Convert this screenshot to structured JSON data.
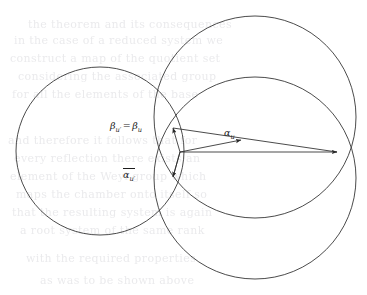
{
  "figure": {
    "background_color": "#ffffff",
    "stroke_color": "#2a2a2a",
    "width": 367,
    "height": 295
  },
  "labels": {
    "beta_equality": {
      "text": "βu′ = βu",
      "beta_left_symbol": "β",
      "beta_left_sub": "u′",
      "relation": "=",
      "beta_right_symbol": "β",
      "beta_right_sub": "u",
      "x": 110,
      "y": 121
    },
    "alpha_u": {
      "text": "αu",
      "symbol": "α",
      "sub": "u",
      "x": 224,
      "y": 128
    },
    "alpha_u_prime_bar": {
      "text": "αu′",
      "symbol": "α",
      "sub": "u′",
      "overlined": true,
      "x": 123,
      "y": 168
    }
  },
  "circles": [
    {
      "name": "left-circle",
      "cx": 100,
      "cy": 151,
      "r": 84
    },
    {
      "name": "upper-right-circle",
      "cx": 255,
      "cy": 117,
      "r": 101
    },
    {
      "name": "lower-right-circle",
      "cx": 255,
      "cy": 178,
      "r": 101
    }
  ],
  "vertex": {
    "x": 180,
    "y": 152
  },
  "arrows": [
    {
      "name": "horizontal-alpha-arrow",
      "x1": 180,
      "y1": 152,
      "x2": 337,
      "y2": 152
    },
    {
      "name": "alpha-u-arrow",
      "x1": 180,
      "y1": 152,
      "x2": 241,
      "y2": 140
    },
    {
      "name": "beta-up-arrow",
      "x1": 180,
      "y1": 152,
      "x2": 173,
      "y2": 128
    },
    {
      "name": "beta-down-arrow",
      "x1": 180,
      "y1": 152,
      "x2": 173,
      "y2": 177
    }
  ],
  "connector_lines": [
    {
      "name": "upper-chord-line",
      "x1": 173,
      "y1": 128,
      "x2": 337,
      "y2": 152
    },
    {
      "name": "lower-chord-line",
      "x1": 173,
      "y1": 177,
      "x2": 180,
      "y2": 152
    }
  ],
  "background_text": {
    "note": "faint scanned page bleed-through, illegible",
    "lines": [
      {
        "content": "the theorem and its consequences",
        "x": 28,
        "y": 18,
        "size": 11
      },
      {
        "content": "in the case of a reduced system we",
        "x": 14,
        "y": 34,
        "size": 11
      },
      {
        "content": "construct a map of the quotient set",
        "x": 10,
        "y": 52,
        "size": 11
      },
      {
        "content": "considering the associated group",
        "x": 18,
        "y": 70,
        "size": 11
      },
      {
        "content": "for all the elements of the base",
        "x": 12,
        "y": 88,
        "size": 11
      },
      {
        "content": "and therefore it follows that for",
        "x": 8,
        "y": 134,
        "size": 11
      },
      {
        "content": "every reflection there exists an",
        "x": 14,
        "y": 152,
        "size": 11
      },
      {
        "content": "element of the Weyl group which",
        "x": 10,
        "y": 170,
        "size": 11
      },
      {
        "content": "maps the chamber onto itself so",
        "x": 16,
        "y": 188,
        "size": 11
      },
      {
        "content": "that the resulting system is again",
        "x": 12,
        "y": 206,
        "size": 11
      },
      {
        "content": "a root system of the same rank",
        "x": 20,
        "y": 224,
        "size": 11
      },
      {
        "content": "with the required properties",
        "x": 26,
        "y": 252,
        "size": 11
      },
      {
        "content": "as was to be shown above",
        "x": 40,
        "y": 274,
        "size": 11
      }
    ]
  }
}
